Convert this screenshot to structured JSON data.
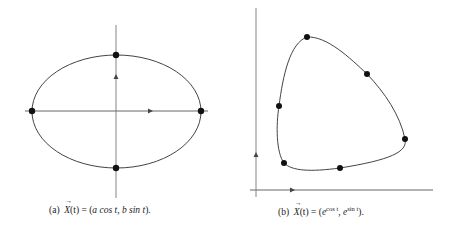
{
  "figure": {
    "subfigures": [
      {
        "label": "(a)",
        "caption_prefix": "(a)",
        "caption_lhs": "X",
        "caption_arg": "(t) = (",
        "caption_body": "a cos t, b sin t",
        "caption_end": ").",
        "curve": "ellipse",
        "marked_points": 4
      },
      {
        "label": "(b)",
        "caption_prefix": "(b)",
        "caption_lhs": "X",
        "caption_arg": "(t) = (",
        "exp1": "cos t",
        "exp2": "sin t",
        "caption_end": ").",
        "curve": "closed loop",
        "marked_points": 6
      }
    ]
  },
  "colors": {
    "curve": "#444444",
    "axis": "#666666",
    "point": "#111111"
  }
}
